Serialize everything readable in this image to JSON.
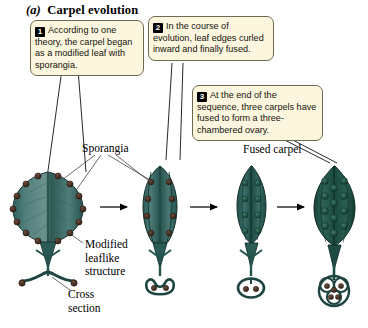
{
  "figure": {
    "panel_letter": "(a)",
    "title": "Carpel evolution",
    "title_full": "(a)  Carpel evolution"
  },
  "callouts": [
    {
      "number": "1",
      "text": "According to one theory, the carpel began as a modified leaf with sporangia."
    },
    {
      "number": "2",
      "text": "In the course of evolution, leaf edges curled inward and finally fused."
    },
    {
      "number": "3",
      "text": "At the end of the sequence, three carpels have fused to form a three-chambered ovary."
    }
  ],
  "labels": {
    "sporangia": "Sporangia",
    "fused_carpel": "Fused carpel",
    "modified_leaflike_structure": "Modified\nleaflike\nstructure",
    "cross_section": "Cross\nsection"
  },
  "stages": [
    {
      "index": 1,
      "name": "modified-leaf-with-sporangia",
      "description": "Broad flat leaf with sporangia around the margin",
      "cross_section": "open-flat"
    },
    {
      "index": 2,
      "name": "leaf-edges-curling-inward",
      "description": "Narrower leaf with edges curling inward, sporangia along folds",
      "cross_section": "curled-c-shape-two-sporangia"
    },
    {
      "index": 3,
      "name": "fused-carpel",
      "description": "Single fused carpel enclosing sporangia",
      "cross_section": "closed-ring-two-sporangia"
    },
    {
      "index": 4,
      "name": "three-chambered-ovary",
      "description": "Three carpels fused into a three-chambered ovary",
      "cross_section": "three-lobed-chambers"
    }
  ],
  "arrows": [
    {
      "from": 1,
      "to": 2
    },
    {
      "from": 2,
      "to": 3
    },
    {
      "from": 3,
      "to": 4
    }
  ],
  "colors": {
    "callout_fill": "#fbf6dd",
    "callout_border": "#6d6a52",
    "badge_fill": "#000000",
    "leaf_light": "#5e8a88",
    "leaf_mid": "#3f6f6b",
    "leaf_dark": "#20514c",
    "leaf_darkest": "#123b33",
    "sporangium": "#4a3326",
    "outline": "#1a2b28",
    "text": "#000000"
  }
}
